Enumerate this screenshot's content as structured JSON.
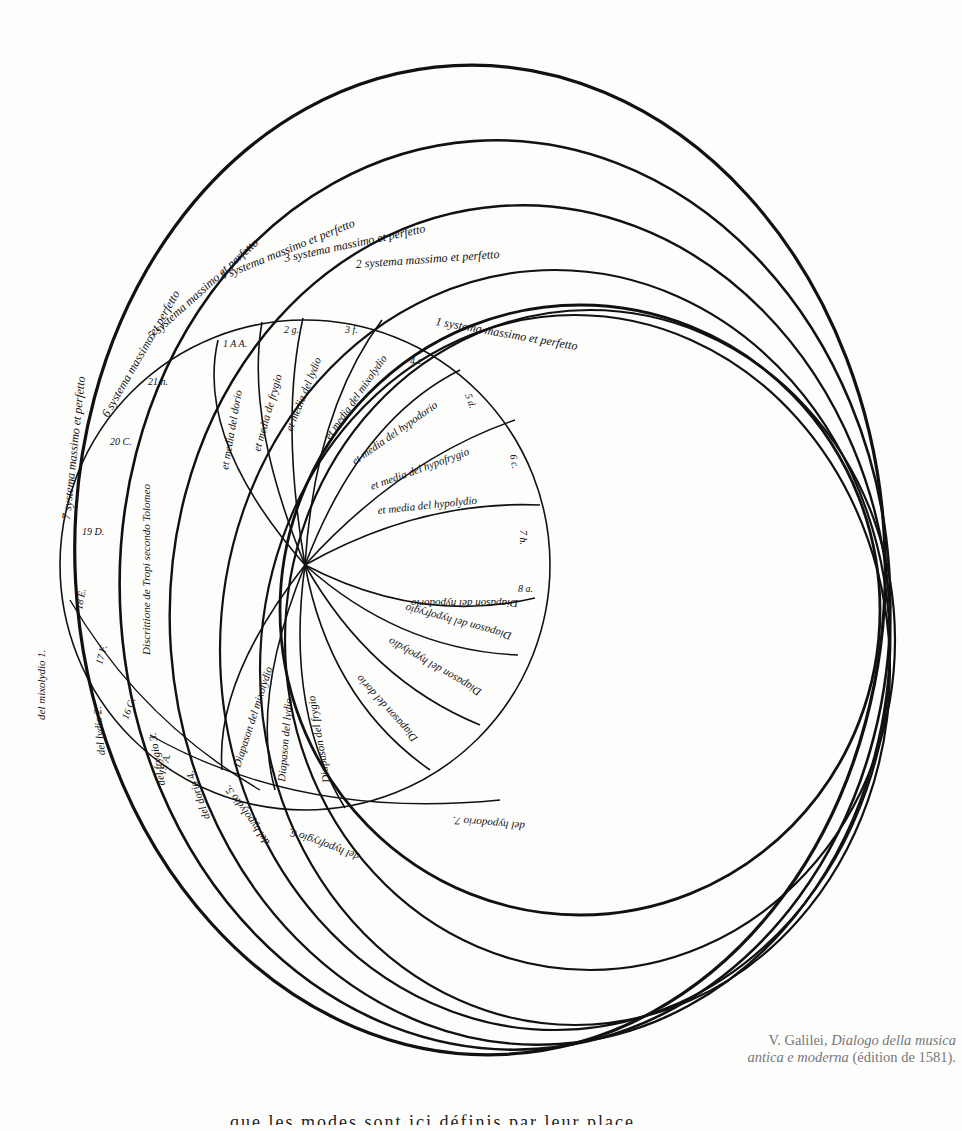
{
  "figure": {
    "type": "historical-music-theory-diagram",
    "outer_system_labels": [
      "1 systema massimo et perfetto",
      "2 systema massimo et perfetto",
      "3 systema massimo et perfetto",
      "4 systema massimo et perfetto",
      "5 systema massimo et perfetto",
      "6 systema massimo et perfetto",
      "7 systema massimo et perfetto"
    ],
    "media_labels": [
      "et media del dorio",
      "et media de frygio",
      "et media del lydio",
      "et media del mixolydio",
      "et media del hypodorio",
      "et media del hypofrygio",
      "et media del hypolydio"
    ],
    "diapason_labels": [
      "Diapason del hypodorio",
      "Diapason del hypofrygio",
      "Diapason del hypolydio",
      "Diapason del dorio",
      "Diapason del frygio",
      "Diapason del lydio",
      "Diapason del mixolydio"
    ],
    "lower_labels": [
      "del hypodorio 7.",
      "del hypofrygio 6.",
      "del hypolydio 5.",
      "del dorio 4.",
      "del frygio 3.",
      "del lydio 2.",
      "del mixolydio 1."
    ],
    "note_markers": [
      "1 A A.",
      "2 g.",
      "3 f.",
      "4 e.",
      "5 d.",
      "6 c.",
      "7 h.",
      "8 a.",
      "9 G.",
      "10 F.",
      "11 E.",
      "12 D.",
      "13 C.",
      "14 h.",
      "15 A.",
      "16 G.",
      "17 F.",
      "18 E.",
      "19 D.",
      "20 C.",
      "21 h."
    ],
    "center_text": "Discrittione de Tropi secondo Tolomeo"
  },
  "caption": {
    "author": "V. Galilei,",
    "title_line1": "Dialogo della musica",
    "title_line2": "antica e moderna",
    "edition": "(édition de 1581)."
  },
  "bottom_cut_text": "que les modes sont ici définis par leur place"
}
